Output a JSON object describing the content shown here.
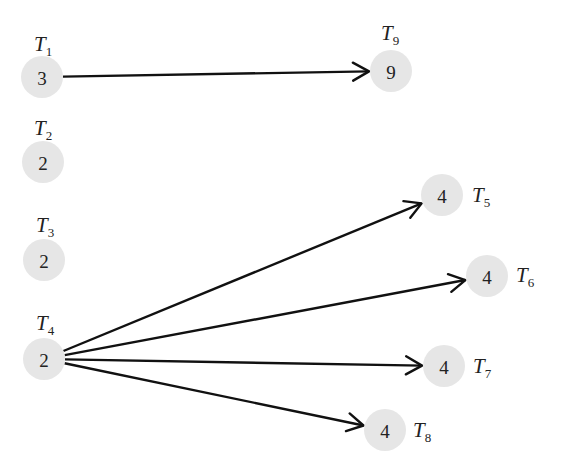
{
  "diagram": {
    "type": "task-dependency-graph",
    "nodes": [
      {
        "id": "T1",
        "label": "T",
        "sub": "1",
        "weight": "3",
        "cx": 42,
        "cy": 77,
        "lx": 34,
        "ly": 51
      },
      {
        "id": "T2",
        "label": "T",
        "sub": "2",
        "weight": "2",
        "cx": 43,
        "cy": 162,
        "lx": 34,
        "ly": 135
      },
      {
        "id": "T3",
        "label": "T",
        "sub": "3",
        "weight": "2",
        "cx": 44,
        "cy": 260,
        "lx": 36,
        "ly": 232
      },
      {
        "id": "T4",
        "label": "T",
        "sub": "4",
        "weight": "2",
        "cx": 44,
        "cy": 359,
        "lx": 36,
        "ly": 330
      },
      {
        "id": "T5",
        "label": "T",
        "sub": "5",
        "weight": "4",
        "cx": 442,
        "cy": 195,
        "lx": 472,
        "ly": 202
      },
      {
        "id": "T6",
        "label": "T",
        "sub": "6",
        "weight": "4",
        "cx": 487,
        "cy": 276,
        "lx": 516,
        "ly": 282
      },
      {
        "id": "T7",
        "label": "T",
        "sub": "7",
        "weight": "4",
        "cx": 444,
        "cy": 366,
        "lx": 473,
        "ly": 373
      },
      {
        "id": "T8",
        "label": "T",
        "sub": "8",
        "weight": "4",
        "cx": 385,
        "cy": 430,
        "lx": 413,
        "ly": 437
      },
      {
        "id": "T9",
        "label": "T",
        "sub": "9",
        "weight": "9",
        "cx": 391,
        "cy": 71,
        "lx": 381,
        "ly": 40
      }
    ],
    "edges": [
      {
        "from": "T1",
        "to": "T9"
      },
      {
        "from": "T4",
        "to": "T5"
      },
      {
        "from": "T4",
        "to": "T6"
      },
      {
        "from": "T4",
        "to": "T7"
      },
      {
        "from": "T4",
        "to": "T8"
      }
    ],
    "colors": {
      "node_fill": "#e6e6e6",
      "edge": "#111111",
      "text": "#222222"
    }
  }
}
